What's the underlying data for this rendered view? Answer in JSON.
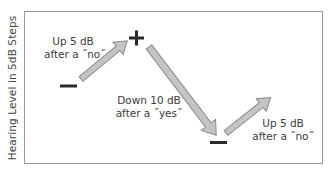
{
  "diagram": {
    "y_axis_label": "Hearing Level in 5dB Steps",
    "symbols": {
      "start_minus": "minus-sign",
      "peak_plus": "plus-sign",
      "end_minus": "minus-sign"
    },
    "steps": [
      {
        "line1": "Up 5 dB",
        "line2": "after a ˝no˝",
        "direction": "up"
      },
      {
        "line1": "Down 10 dB",
        "line2": "after a ˝yes˝",
        "direction": "down"
      },
      {
        "line1": "Up 5 dB",
        "line2": "after a ˝no˝",
        "direction": "up"
      }
    ],
    "colors": {
      "arrow_fill": "#c4c4c4",
      "arrow_stroke": "#8a8a8a",
      "frame": "#9a9a9a",
      "symbol": "#2a2a2a"
    }
  }
}
